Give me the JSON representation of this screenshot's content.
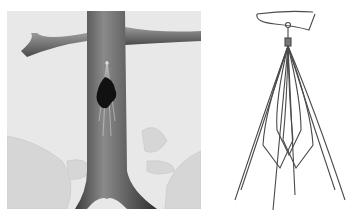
{
  "figure": {
    "panels": [
      {
        "id": "left",
        "subject": "vena-cava-with-filter-and-trapped-clot",
        "background": "#e6e6e6",
        "vessel_color": "#5a5a5a",
        "clot_color": "#111111"
      },
      {
        "id": "right",
        "subject": "ivc-filter-device-drawing",
        "background": "#ffffff",
        "wire_color": "#4a4a4a"
      }
    ]
  }
}
